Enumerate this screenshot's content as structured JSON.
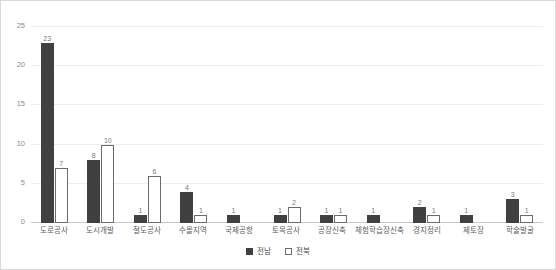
{
  "chart_data": {
    "type": "bar",
    "title": "",
    "subtitle": "",
    "xlabel": "",
    "ylabel": "",
    "ylim": [
      0,
      25
    ],
    "yticks": [
      0,
      5,
      10,
      15,
      20,
      25
    ],
    "grid": true,
    "legend_position": "bottom-center",
    "categories": [
      "도로공사",
      "도시개발",
      "철도공사",
      "수몰지역",
      "국제공항",
      "토목공사",
      "공장신축",
      "체험학습장신축",
      "경지정리",
      "제토장",
      "학술발굴"
    ],
    "series": [
      {
        "name": "전남",
        "color": "#404040",
        "style": "filled",
        "values": [
          23,
          8,
          1,
          4,
          1,
          1,
          1,
          1,
          2,
          1,
          3
        ]
      },
      {
        "name": "전북",
        "color": "#ffffff",
        "border_color": "#6b6b6b",
        "style": "outlined",
        "values": [
          7,
          10,
          6,
          1,
          null,
          2,
          1,
          null,
          1,
          null,
          1
        ]
      }
    ]
  },
  "axis": {
    "ytick_labels": [
      "0",
      "5",
      "10",
      "15",
      "20",
      "25"
    ]
  },
  "legend": {
    "items": [
      {
        "label": "전남",
        "swatch": "filled-dark-square"
      },
      {
        "label": "전북",
        "swatch": "outlined-white-square"
      }
    ]
  },
  "colors": {
    "series_a": "#404040",
    "series_b_fill": "#ffffff",
    "series_b_border": "#6b6b6b",
    "gridline": "#ededed",
    "axis_base": "#c8c8c8",
    "frame_border": "#d9d9d9",
    "tick_text": "#8c8c8c",
    "label_text": "#5e5e5e",
    "value_text": "#7a7a7a"
  }
}
